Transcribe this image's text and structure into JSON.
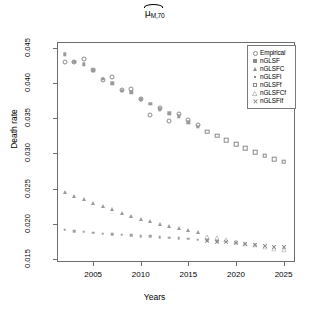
{
  "chart_data": {
    "type": "scatter",
    "title_parts": {
      "symbol": "μ",
      "subscript": "M,70"
    },
    "xlabel": "Years",
    "ylabel": "Death rate",
    "xlim": [
      2001.2,
      2026.2
    ],
    "ylim": [
      0.01455,
      0.04585
    ],
    "xticks": [
      2005,
      2010,
      2015,
      2020,
      2025
    ],
    "yticks": [
      "0.015",
      "0.020",
      "0.025",
      "0.030",
      "0.035",
      "0.040",
      "0.045"
    ],
    "ytick_values": [
      0.015,
      0.02,
      0.025,
      0.03,
      0.035,
      0.04,
      0.045
    ],
    "grid": false,
    "legend_position": "top-right",
    "series": [
      {
        "name": "Empirical",
        "marker": "open-circle",
        "color": "#8a8a8a",
        "x": [
          2002,
          2003,
          2004,
          2005,
          2006,
          2007,
          2008,
          2009,
          2010,
          2011,
          2012,
          2013,
          2014,
          2015,
          2016
        ],
        "y": [
          0.043,
          0.043,
          0.0435,
          0.0419,
          0.0405,
          0.0409,
          0.039,
          0.0392,
          0.0377,
          0.0355,
          0.0364,
          0.0346,
          0.0356,
          0.0347,
          0.034
        ]
      },
      {
        "name": "nGLSF",
        "marker": "filled-square",
        "color": "#9a9a9a",
        "x": [
          2002,
          2003,
          2004,
          2005,
          2006,
          2007,
          2008,
          2009,
          2010,
          2011,
          2012,
          2013,
          2014,
          2015,
          2016
        ],
        "y": [
          0.0441,
          0.043,
          0.0427,
          0.0418,
          0.0406,
          0.04,
          0.0389,
          0.0387,
          0.0377,
          0.0371,
          0.0363,
          0.0357,
          0.0353,
          0.0344,
          0.0338
        ]
      },
      {
        "name": "nGLSFC",
        "marker": "filled-triangle",
        "color": "#9a9a9a",
        "x": [
          2002,
          2003,
          2004,
          2005,
          2006,
          2007,
          2008,
          2009,
          2010,
          2011,
          2012,
          2013,
          2014,
          2015,
          2016
        ],
        "y": [
          0.0245,
          0.024,
          0.02345,
          0.023,
          0.02255,
          0.02205,
          0.02155,
          0.02115,
          0.0207,
          0.02035,
          0.02,
          0.01965,
          0.01935,
          0.0191,
          0.0188
        ]
      },
      {
        "name": "nGLSFI",
        "marker": "filled-square-small",
        "color": "#a0a0a0",
        "x": [
          2002,
          2003,
          2004,
          2005,
          2006,
          2007,
          2008,
          2009,
          2010,
          2011,
          2012,
          2013,
          2014,
          2015,
          2016,
          2017,
          2018
        ],
        "y": [
          0.01915,
          0.0189,
          0.01885,
          0.0187,
          0.0186,
          0.0185,
          0.01845,
          0.01835,
          0.01825,
          0.0182,
          0.0181,
          0.018,
          0.0179,
          0.01785,
          0.01775,
          0.01765,
          0.01755
        ]
      },
      {
        "name": "nGLSFf",
        "marker": "open-square",
        "color": "#8a8a8a",
        "x": [
          2017,
          2018,
          2019,
          2020,
          2021,
          2022,
          2023,
          2024,
          2025
        ],
        "y": [
          0.0331,
          0.0325,
          0.0319,
          0.0313,
          0.0307,
          0.0302,
          0.0297,
          0.0292,
          0.0288
        ]
      },
      {
        "name": "nGLSFCf",
        "marker": "open-triangle",
        "color": "#8a8a8a",
        "x": [
          2017,
          2018,
          2019,
          2020,
          2021,
          2022,
          2023,
          2024,
          2025
        ],
        "y": [
          0.01815,
          0.0179,
          0.01765,
          0.01745,
          0.01715,
          0.0169,
          0.01665,
          0.01645,
          0.0162
        ]
      },
      {
        "name": "nGLSFIf",
        "marker": "cross-x",
        "color": "#8a8a8a",
        "x": [
          2017,
          2018,
          2019,
          2020,
          2021,
          2022,
          2023,
          2024,
          2025
        ],
        "y": [
          0.0176,
          0.01745,
          0.01735,
          0.01725,
          0.01715,
          0.017,
          0.01688,
          0.01675,
          0.01665
        ]
      }
    ],
    "legend": [
      {
        "label": "Empirical",
        "marker": "open-circle"
      },
      {
        "label": "nGLSF",
        "marker": "filled-square"
      },
      {
        "label": "nGLSFC",
        "marker": "filled-triangle"
      },
      {
        "label": "nGLSFI",
        "marker": "filled-square-small"
      },
      {
        "label": "nGLSFf",
        "marker": "open-square"
      },
      {
        "label": "nGLSFCf",
        "marker": "open-triangle"
      },
      {
        "label": "nGLSFIf",
        "marker": "cross-x"
      }
    ]
  }
}
